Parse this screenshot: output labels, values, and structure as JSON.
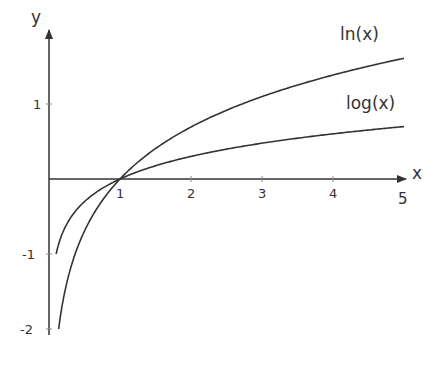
{
  "chart_data": {
    "type": "line",
    "title": "",
    "xlabel": "x",
    "ylabel": "y",
    "xlim": [
      0,
      5
    ],
    "ylim": [
      -2,
      1.7
    ],
    "xticks": [
      "1",
      "2",
      "3",
      "4",
      "5"
    ],
    "yticks": [
      "1",
      "-1",
      "-2"
    ],
    "grid": false,
    "series": [
      {
        "name": "ln(x)",
        "function": "ln(x)",
        "x": [
          0.135,
          0.25,
          0.5,
          1,
          2,
          3,
          4,
          5
        ],
        "values": [
          -2.0,
          -1.386,
          -0.693,
          0,
          0.693,
          1.099,
          1.386,
          1.609
        ]
      },
      {
        "name": "log(x)",
        "function": "log10(x)",
        "x": [
          0.1,
          0.25,
          0.5,
          1,
          2,
          3,
          4,
          5
        ],
        "values": [
          -1.0,
          -0.602,
          -0.301,
          0,
          0.301,
          0.477,
          0.602,
          0.699
        ]
      }
    ],
    "annotations": [
      "ln(x)",
      "log(x)"
    ]
  },
  "labels": {
    "x_axis": "x",
    "y_axis": "y",
    "x_ticks": [
      "1",
      "2",
      "3",
      "4",
      "5"
    ],
    "y_ticks": {
      "p1": "1",
      "m1": "-1",
      "m2": "-2"
    },
    "ln_label": "ln(x)",
    "log_label": "log(x)"
  },
  "colors": {
    "line": "#333333"
  }
}
